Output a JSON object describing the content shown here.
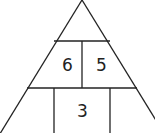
{
  "diagram": {
    "type": "number-pyramid",
    "line_color": "#222222",
    "background": "#ffffff",
    "rows": [
      {
        "row": 1,
        "cells": [
          {
            "value": ""
          }
        ]
      },
      {
        "row": 2,
        "cells": [
          {
            "value": "6"
          },
          {
            "value": "5"
          }
        ]
      },
      {
        "row": 3,
        "cells": [
          {
            "value": ""
          },
          {
            "value": "3"
          },
          {
            "value": ""
          }
        ]
      }
    ]
  }
}
